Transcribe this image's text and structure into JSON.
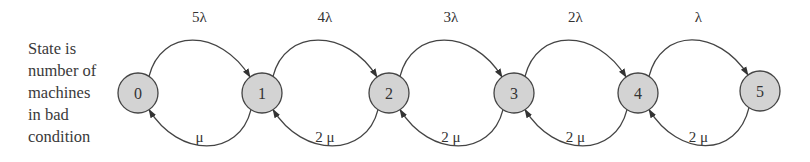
{
  "caption": {
    "lines": [
      "State is",
      "number of",
      "machines",
      "in bad",
      "condition"
    ]
  },
  "colors": {
    "node_fill": "#d3d3d3",
    "stroke": "#444444",
    "text": "#333333"
  },
  "states": [
    {
      "id": "0",
      "cx": 138,
      "cy": 93
    },
    {
      "id": "1",
      "cx": 262,
      "cy": 93
    },
    {
      "id": "2",
      "cx": 389,
      "cy": 93
    },
    {
      "id": "3",
      "cx": 514,
      "cy": 93
    },
    {
      "id": "4",
      "cx": 638,
      "cy": 93
    },
    {
      "id": "5",
      "cx": 760,
      "cy": 91
    }
  ],
  "forward_rates": [
    "5λ",
    "4λ",
    "3λ",
    "2λ",
    "λ"
  ],
  "backward_rates": [
    "μ",
    "2 μ",
    "2 μ",
    "2 μ",
    "2 μ"
  ]
}
